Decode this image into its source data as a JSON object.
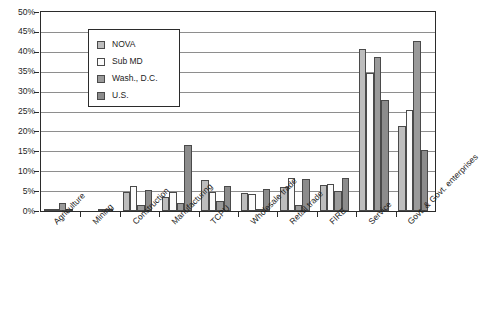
{
  "chart_data": {
    "type": "bar",
    "title": "",
    "subtitle": "",
    "xlabel": "",
    "ylabel": "",
    "ylim": [
      0,
      50
    ],
    "ytick_step": 5,
    "ytick_labels": [
      "50%",
      "45%",
      "40%",
      "35%",
      "30%",
      "25%",
      "20%",
      "15%",
      "10%",
      "5%",
      "0%"
    ],
    "grid": true,
    "grid_axis": "y",
    "legend_position": "upper-left-inside",
    "value_unit": "percent",
    "categories": [
      "Agriculture",
      "Mining",
      "Construction",
      "Manufacturing",
      "TCPU",
      "Wholesale trade",
      "Retail trade",
      "FIRE",
      "Service",
      "Govt. & Govt. enterprises"
    ],
    "series": [
      {
        "name": "NOVA",
        "color": "#bdbdbd",
        "values": [
          0.4,
          0.0,
          4.8,
          3.5,
          7.8,
          4.6,
          6.0,
          6.6,
          40.6,
          21.3
        ]
      },
      {
        "name": "Sub MD",
        "color": "#fbfbfb",
        "values": [
          0.4,
          0.0,
          6.3,
          4.7,
          4.9,
          4.3,
          8.4,
          6.7,
          34.6,
          25.4
        ]
      },
      {
        "name": "Wash., D.C.",
        "color": "#9a9a9a",
        "values": [
          2.0,
          0.1,
          1.5,
          2.0,
          2.4,
          0.4,
          1.5,
          5.0,
          38.6,
          42.6
        ]
      },
      {
        "name": "U.S.",
        "color": "#8c8c8c",
        "values": [
          0.5,
          0.6,
          5.4,
          16.6,
          6.3,
          5.6,
          8.1,
          8.3,
          27.8,
          15.4
        ]
      }
    ]
  },
  "legend": {
    "items": [
      {
        "label": "NOVA"
      },
      {
        "label": "Sub MD"
      },
      {
        "label": "Wash., D.C."
      },
      {
        "label": "U.S."
      }
    ]
  }
}
